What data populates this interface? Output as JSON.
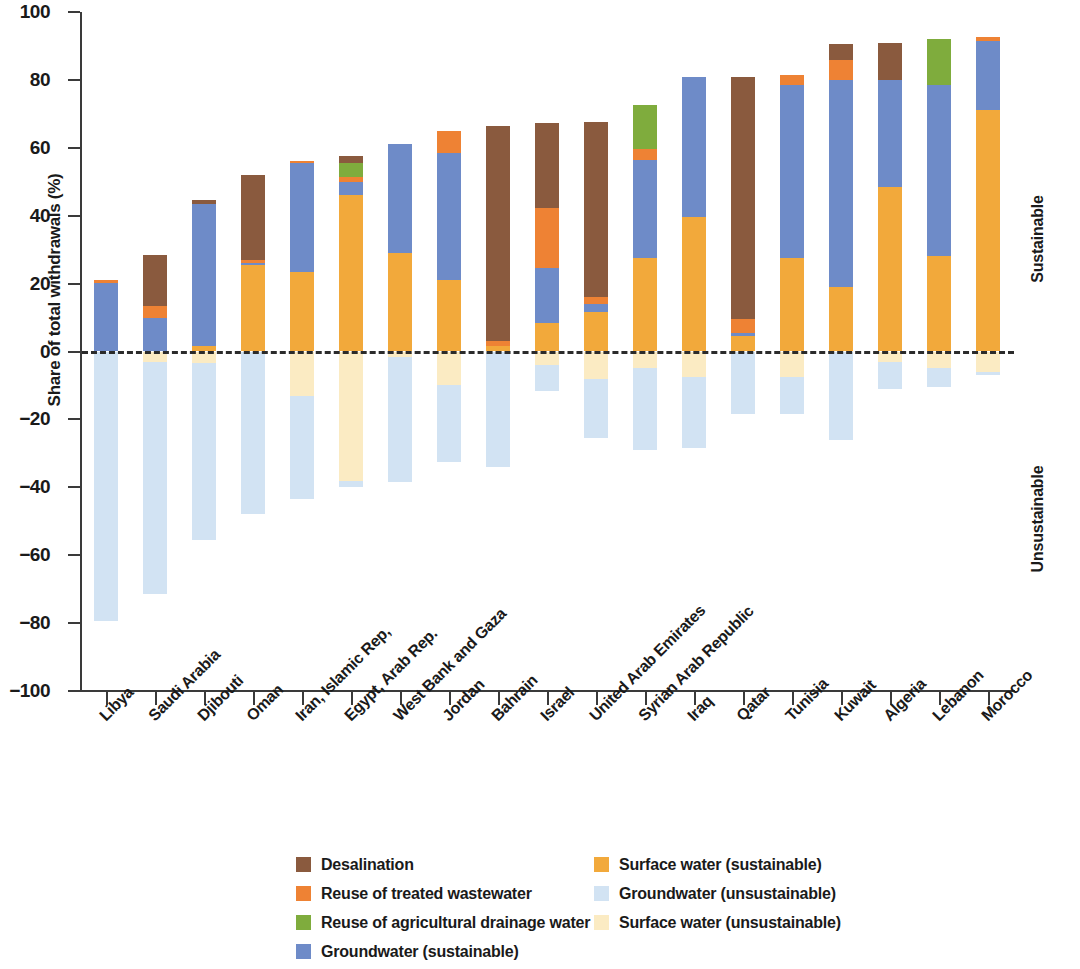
{
  "chart_data": {
    "type": "bar",
    "stacked": true,
    "title": "",
    "xlabel": "",
    "ylabel": "Share of total withdrawals (%)",
    "ylim": [
      -100,
      100
    ],
    "yticks": [
      100,
      80,
      60,
      40,
      20,
      0,
      -20,
      -40,
      -60,
      -80,
      -100
    ],
    "ytick_labels": [
      "100",
      "80",
      "60",
      "40",
      "20",
      "0",
      "−20",
      "−40",
      "−60",
      "−80",
      "−100"
    ],
    "grid": false,
    "legend_position": "bottom",
    "zero_reference_line": true,
    "side_labels": {
      "positive": "Sustainable",
      "negative": "Unsustainable"
    },
    "categories": [
      "Libya",
      "Saudi Arabia",
      "Djibouti",
      "Oman",
      "Iran, Islamic Rep,",
      "Egypt, Arab Rep.",
      "West Bank and Gaza",
      "Jordan",
      "Bahrain",
      "Israel",
      "United Arab Emirates",
      "Syrian Arab Republic",
      "Iraq",
      "Qatar",
      "Tunisia",
      "Kuwait",
      "Algeria",
      "Lebanon",
      "Morocco"
    ],
    "series": [
      {
        "name": "Surface water (sustainable)",
        "key": "surface_sustainable",
        "color": "#F2A93B",
        "values": [
          0,
          0,
          1.5,
          25.5,
          23.5,
          46,
          29,
          21,
          1.5,
          8.5,
          11.5,
          27.5,
          39.5,
          4.5,
          27.5,
          19,
          48.5,
          28,
          71
        ]
      },
      {
        "name": "Groundwater (sustainable)",
        "key": "groundwater_sustainable",
        "color": "#6E8BC8",
        "values": [
          20.3,
          9.8,
          42,
          0.7,
          32,
          4,
          32,
          37.5,
          0,
          16.2,
          2.5,
          29,
          41.5,
          1,
          51,
          61,
          31.5,
          50.5,
          20.5
        ]
      },
      {
        "name": "Reuse of treated wastewater",
        "key": "reuse_wastewater",
        "color": "#EE8234",
        "values": [
          0.7,
          3.5,
          0,
          0.8,
          0.5,
          1.5,
          0,
          6.5,
          1.5,
          17.5,
          2,
          3,
          0,
          4,
          3,
          6,
          0,
          0,
          1
        ]
      },
      {
        "name": "Reuse of agricultural drainage water",
        "key": "reuse_drainage",
        "color": "#7FAC3D",
        "values": [
          0,
          0,
          0,
          0,
          0,
          4,
          0,
          0,
          0,
          0,
          0,
          13,
          0,
          0,
          0,
          0,
          0,
          13.5,
          0
        ]
      },
      {
        "name": "Desalination",
        "key": "desalination",
        "color": "#8A5A3E",
        "values": [
          0,
          15,
          1,
          25,
          0,
          2,
          0,
          0,
          63.5,
          25,
          51.5,
          0,
          0,
          71.5,
          0,
          4.5,
          11,
          0,
          0
        ]
      },
      {
        "name": "Surface water (unsustainable)",
        "key": "surface_unsustainable",
        "color": "#FBEBC3",
        "values": [
          0,
          -3,
          -3.5,
          0,
          -13,
          -38,
          -1.5,
          -10,
          0,
          -4,
          -8,
          -5,
          -7.5,
          0,
          -7.5,
          0,
          -3,
          -5,
          -6
        ]
      },
      {
        "name": "Groundwater (unsustainable)",
        "key": "groundwater_unsustainable",
        "color": "#D2E3F3",
        "values": [
          -79.5,
          -68.5,
          -52,
          -48,
          -30.5,
          -2,
          -37,
          -22.5,
          -34,
          -7.5,
          -17.5,
          -24,
          -21,
          -18.5,
          -11,
          -26,
          -8,
          -5.5,
          -1
        ]
      }
    ],
    "stack_order_positive": [
      "surface_sustainable",
      "groundwater_sustainable",
      "reuse_wastewater",
      "reuse_drainage",
      "desalination"
    ],
    "stack_order_negative": [
      "surface_unsustainable",
      "groundwater_unsustainable"
    ]
  },
  "legend": {
    "left_column": [
      {
        "label": "Desalination",
        "color": "#8A5A3E",
        "icon": "swatch-desalination"
      },
      {
        "label": "Reuse of treated wastewater",
        "color": "#EE8234",
        "icon": "swatch-reuse-wastewater"
      },
      {
        "label": "Reuse of agricultural drainage water",
        "color": "#7FAC3D",
        "icon": "swatch-reuse-drainage"
      },
      {
        "label": "Groundwater (sustainable)",
        "color": "#6E8BC8",
        "icon": "swatch-groundwater-sustainable"
      }
    ],
    "right_column": [
      {
        "label": "Surface water (sustainable)",
        "color": "#F2A93B",
        "icon": "swatch-surface-sustainable"
      },
      {
        "label": "Groundwater (unsustainable)",
        "color": "#D2E3F3",
        "icon": "swatch-groundwater-unsustainable"
      },
      {
        "label": "Surface water (unsustainable)",
        "color": "#FBEBC3",
        "icon": "swatch-surface-unsustainable"
      }
    ]
  }
}
